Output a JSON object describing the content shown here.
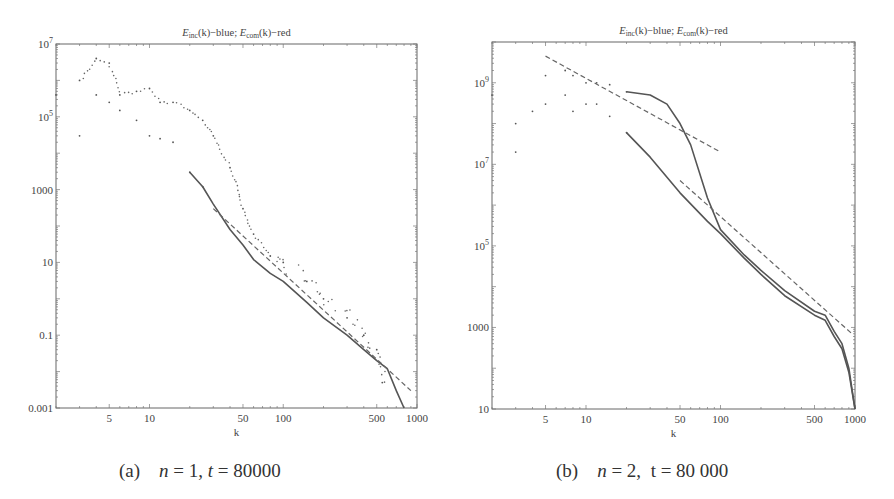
{
  "figure": {
    "panels": [
      {
        "id": "a",
        "title_parts": [
          "E",
          "inc",
          "(k)−blue; ",
          "E",
          "com",
          "(k)−red"
        ],
        "caption": {
          "label": "(a)",
          "n_var": "n",
          "n_value": "= 1,",
          "t_var": "t",
          "t_value": "= 80000"
        },
        "xlabel": "k",
        "xticks": [
          "5",
          "10",
          "50",
          "100",
          "500",
          "1000"
        ],
        "yticks": [
          "10^7",
          "10^5",
          "1000",
          "10",
          "0.1",
          "0.001"
        ]
      },
      {
        "id": "b",
        "title_parts": [
          "E",
          "inc",
          "(k)−blue; ",
          "E",
          "com",
          "(k)−red"
        ],
        "caption": {
          "label": "(b)",
          "n_var": "n",
          "n_value": "= 2,",
          "t_var": "t",
          "t_value": "= 80 000"
        },
        "xlabel": "k",
        "xticks": [
          "5",
          "10",
          "50",
          "100",
          "500",
          "1000"
        ],
        "yticks": [
          "10^9",
          "10^7",
          "10^5",
          "1000",
          "10"
        ]
      }
    ]
  },
  "chart_data": [
    {
      "type": "scatter",
      "title": "E_inc(k)-blue; E_com(k)-red",
      "subtitle": "(a) n = 1, t = 80000",
      "xlabel": "k",
      "ylabel": "",
      "xscale": "log",
      "yscale": "log",
      "xlim": [
        2,
        1000
      ],
      "ylim": [
        0.001,
        10000000
      ],
      "xticks": [
        5,
        10,
        50,
        100,
        500,
        1000
      ],
      "yticks": [
        10000000,
        100000,
        1000,
        10,
        0.1,
        0.001
      ],
      "grid": false,
      "legend": "none (colors described in title)",
      "series": [
        {
          "name": "E_inc(k) (blue)",
          "style": "points merging to solid line",
          "x": [
            2,
            3,
            4,
            5,
            6,
            8,
            10,
            12,
            15,
            20,
            25,
            30,
            40,
            50,
            60,
            80,
            100,
            150,
            200,
            300,
            400,
            500,
            600,
            700,
            800
          ],
          "y": [
            400000,
            30000,
            400000,
            250000,
            150000,
            80000,
            30000,
            25000,
            20000,
            3000,
            1200,
            400,
            80,
            30,
            12,
            5,
            3,
            0.8,
            0.3,
            0.1,
            0.04,
            0.02,
            0.012,
            0.003,
            0.001
          ]
        },
        {
          "name": "E_com(k) (red)",
          "style": "scattered points",
          "x": [
            3,
            4,
            5,
            6,
            8,
            10,
            12,
            15,
            20,
            25,
            30,
            40,
            50,
            60,
            80,
            100,
            150,
            200,
            300,
            400,
            500,
            550
          ],
          "y": [
            1000000,
            4000000,
            3000000,
            400000,
            500000,
            600000,
            250000,
            250000,
            150000,
            80000,
            30000,
            4000,
            300,
            60,
            15,
            10,
            3,
            1,
            0.3,
            0.1,
            0.04,
            0.005
          ]
        },
        {
          "name": "Power-law fit (dashed)",
          "style": "dashed",
          "x": [
            30,
            900
          ],
          "y": [
            300,
            0.003
          ]
        }
      ]
    },
    {
      "type": "scatter",
      "title": "E_inc(k)-blue; E_com(k)-red",
      "subtitle": "(b) n = 2, t = 80 000",
      "xlabel": "k",
      "ylabel": "",
      "xscale": "log",
      "yscale": "log",
      "xlim": [
        2,
        1000
      ],
      "ylim": [
        10,
        10000000000
      ],
      "xticks": [
        5,
        10,
        50,
        100,
        500,
        1000
      ],
      "yticks": [
        1000000000,
        10000000,
        100000,
        1000,
        10
      ],
      "grid": false,
      "legend": "none (colors described in title)",
      "series": [
        {
          "name": "E_inc(k) (blue)",
          "style": "points merging to solid line",
          "x": [
            2,
            3,
            4,
            5,
            7,
            8,
            10,
            12,
            15,
            20,
            30,
            50,
            80,
            100,
            150,
            200,
            300,
            500,
            600,
            700,
            800,
            900,
            1000
          ],
          "y": [
            500000000,
            20000000,
            200000000,
            300000000,
            500000000,
            200000000,
            300000000,
            300000000,
            150000000,
            60000000,
            15000000,
            2000000,
            400000,
            200000,
            50000,
            20000,
            6000,
            2000,
            1500,
            600,
            300,
            80,
            10
          ]
        },
        {
          "name": "E_com(k) (red)",
          "style": "points merging to solid line",
          "x": [
            3,
            5,
            7,
            8,
            10,
            12,
            15,
            20,
            30,
            40,
            50,
            60,
            80,
            100,
            150,
            200,
            300,
            500,
            600,
            700,
            800,
            900,
            1000
          ],
          "y": [
            100000000,
            1500000000,
            2000000000,
            1500000000,
            1000000000,
            1000000000,
            900000000,
            600000000,
            500000000,
            300000000,
            100000000,
            30000000,
            1500000,
            250000,
            60000,
            25000,
            8000,
            2500,
            2000,
            800,
            400,
            100,
            10
          ]
        },
        {
          "name": "Power-law fit upper (dashed)",
          "style": "dashed",
          "x": [
            5,
            100
          ],
          "y": [
            4500000000,
            20000000
          ]
        },
        {
          "name": "Power-law fit lower (dashed)",
          "style": "dashed",
          "x": [
            50,
            950
          ],
          "y": [
            4000000,
            700
          ]
        }
      ]
    }
  ]
}
